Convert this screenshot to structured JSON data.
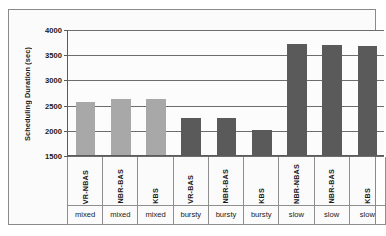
{
  "chart_data": {
    "type": "bar",
    "title": "",
    "subtitle": "",
    "xlabel": "",
    "ylabel": "Scheduling Duration (sec)",
    "ylim": [
      1500,
      4000
    ],
    "ytick_labels": [
      "4000",
      "3500",
      "3000",
      "2500",
      "2000",
      "1500"
    ],
    "ytick_values": [
      4000,
      3500,
      3000,
      2500,
      2000,
      1500
    ],
    "grid": true,
    "legend": "none",
    "categories": [
      "VR-NBAS",
      "NBR-BAS",
      "KBS",
      "VR-BAS",
      "NBR-BAS",
      "KBS",
      "NBR-NBAS",
      "NBR-BAS",
      "KBS"
    ],
    "group_labels": [
      "mixed",
      "mixed",
      "mixed",
      "bursty",
      "bursty",
      "bursty",
      "slow",
      "slow",
      "slow"
    ],
    "values": [
      2555,
      2610,
      2610,
      2235,
      2240,
      1995,
      3700,
      3675,
      3670
    ],
    "bar_colors": [
      "#a8a8a8",
      "#a8a8a8",
      "#a8a8a8",
      "#5a5a5a",
      "#5a5a5a",
      "#5a5a5a",
      "#5a5a5a",
      "#5a5a5a",
      "#5a5a5a"
    ]
  },
  "colors": {
    "light_bar": "#a8a8a8",
    "dark_bar": "#5a5a5a",
    "grid": "#6d6d6d",
    "axis": "#5a5a5a",
    "frame": "#8a8a8a",
    "text": "#1a1a1a"
  }
}
